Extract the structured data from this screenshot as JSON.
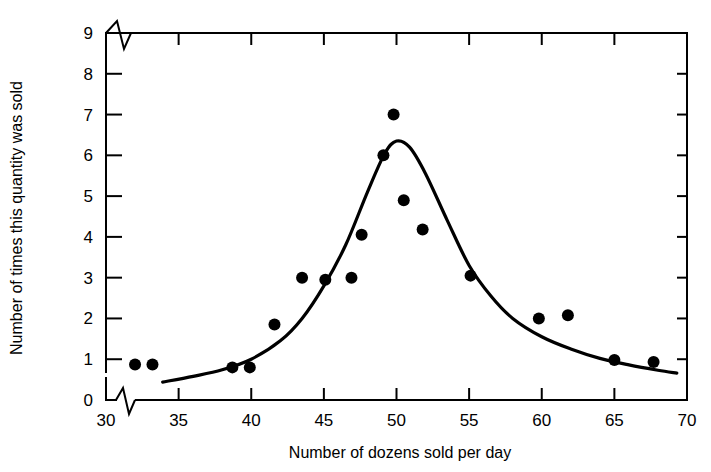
{
  "chart_data": {
    "type": "scatter",
    "title": "",
    "subtitle": "",
    "xlabel": "Number of dozens sold per day",
    "ylabel": "Number of times this quantity was sold",
    "xlim": [
      30,
      70
    ],
    "ylim": [
      0,
      9
    ],
    "x_ticks": [
      30,
      35,
      40,
      45,
      50,
      55,
      60,
      65,
      70
    ],
    "x_tick_labels": [
      "30",
      "35",
      "40",
      "45",
      "50",
      "55",
      "60",
      "65",
      "70"
    ],
    "y_ticks": [
      0,
      1,
      2,
      3,
      4,
      5,
      6,
      7,
      8,
      9
    ],
    "y_tick_labels": [
      "0",
      "1",
      "2",
      "3",
      "4",
      "5",
      "6",
      "7",
      "8",
      "9"
    ],
    "grid": false,
    "legend": null,
    "axis_break_x": true,
    "axis_break_y": true,
    "annotations": [],
    "series": [
      {
        "name": "Observed frequencies",
        "marker": "filled-circle",
        "color": "#000000",
        "points": [
          {
            "x": 32.0,
            "y": 0.87
          },
          {
            "x": 33.2,
            "y": 0.87
          },
          {
            "x": 38.7,
            "y": 0.8
          },
          {
            "x": 39.9,
            "y": 0.8
          },
          {
            "x": 41.6,
            "y": 1.85
          },
          {
            "x": 43.5,
            "y": 3.0
          },
          {
            "x": 45.1,
            "y": 2.95
          },
          {
            "x": 46.9,
            "y": 3.0
          },
          {
            "x": 47.6,
            "y": 4.05
          },
          {
            "x": 49.1,
            "y": 6.0
          },
          {
            "x": 49.8,
            "y": 7.0
          },
          {
            "x": 50.5,
            "y": 4.9
          },
          {
            "x": 51.8,
            "y": 4.18
          },
          {
            "x": 55.1,
            "y": 3.05
          },
          {
            "x": 59.8,
            "y": 2.0
          },
          {
            "x": 61.8,
            "y": 2.08
          },
          {
            "x": 65.0,
            "y": 0.98
          },
          {
            "x": 67.7,
            "y": 0.93
          }
        ]
      },
      {
        "name": "Fitted distribution curve",
        "marker": "none",
        "color": "#000000",
        "curve": [
          {
            "x": 33.9,
            "y": 0.44
          },
          {
            "x": 36.0,
            "y": 0.58
          },
          {
            "x": 38.0,
            "y": 0.74
          },
          {
            "x": 40.0,
            "y": 1.0
          },
          {
            "x": 42.0,
            "y": 1.45
          },
          {
            "x": 43.5,
            "y": 2.0
          },
          {
            "x": 45.0,
            "y": 2.8
          },
          {
            "x": 46.5,
            "y": 3.8
          },
          {
            "x": 48.0,
            "y": 5.1
          },
          {
            "x": 49.2,
            "y": 6.05
          },
          {
            "x": 50.0,
            "y": 6.35
          },
          {
            "x": 50.9,
            "y": 6.2
          },
          {
            "x": 52.0,
            "y": 5.55
          },
          {
            "x": 53.5,
            "y": 4.4
          },
          {
            "x": 55.0,
            "y": 3.3
          },
          {
            "x": 56.5,
            "y": 2.55
          },
          {
            "x": 58.0,
            "y": 2.0
          },
          {
            "x": 60.0,
            "y": 1.55
          },
          {
            "x": 62.0,
            "y": 1.25
          },
          {
            "x": 64.0,
            "y": 1.02
          },
          {
            "x": 66.0,
            "y": 0.86
          },
          {
            "x": 68.0,
            "y": 0.73
          },
          {
            "x": 69.3,
            "y": 0.66
          }
        ]
      }
    ]
  },
  "figure": {
    "background_color": "#ffffff",
    "axis_color": "#000000",
    "marker_color": "#000000",
    "curve_color": "#000000"
  }
}
